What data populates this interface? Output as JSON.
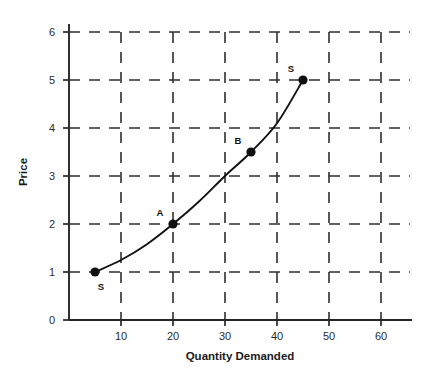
{
  "chart_data": {
    "type": "line",
    "title": "",
    "subtitle": "",
    "xlabel": "Quantity Demanded",
    "ylabel": "Price",
    "xlim": [
      0,
      65
    ],
    "ylim": [
      0,
      6.4
    ],
    "xticks": [
      10,
      20,
      30,
      40,
      50,
      60
    ],
    "yticks": [
      0,
      1,
      2,
      3,
      4,
      5,
      6
    ],
    "grid": true,
    "grid_style": "dashed",
    "legend": "none",
    "series": [
      {
        "name": "Supply curve S",
        "curve_label": "S",
        "x": [
          5,
          10,
          15,
          20,
          25,
          30,
          35,
          40,
          45
        ],
        "y": [
          1.0,
          1.25,
          1.58,
          2.0,
          2.47,
          3.0,
          3.5,
          4.1,
          5.0
        ]
      }
    ],
    "points": [
      {
        "label": "S",
        "x": 5,
        "y": 1.0,
        "label_dx": 6,
        "label_dy": 18
      },
      {
        "label": "A",
        "x": 20,
        "y": 2.0,
        "label_dx": -13,
        "label_dy": -8
      },
      {
        "label": "B",
        "x": 35,
        "y": 3.5,
        "label_dx": -13,
        "label_dy": -8
      },
      {
        "label": "S",
        "x": 45,
        "y": 5.0,
        "label_dx": -12,
        "label_dy": -8
      }
    ],
    "colors": {
      "curve": "#111111",
      "marker": "#111111",
      "grid": "#2e2e2e",
      "axis": "#262626",
      "text": "#1a1a1a",
      "background": "#ffffff"
    }
  },
  "axis_titles": {
    "x": "Quantity Demanded",
    "y": "Price"
  },
  "x_tick_labels": [
    "10",
    "20",
    "30",
    "40",
    "50",
    "60"
  ],
  "y_tick_labels": [
    "0",
    "1",
    "2",
    "3",
    "4",
    "5",
    "6"
  ],
  "point_labels": [
    "S",
    "A",
    "B",
    "S"
  ]
}
